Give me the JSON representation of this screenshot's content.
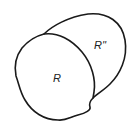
{
  "diagram": {
    "type": "region-diagram",
    "regions": [
      {
        "id": "R",
        "label": "R"
      },
      {
        "id": "R2",
        "label": "R''"
      }
    ],
    "colors": {
      "background": "#ffffff",
      "stroke": "#1a1a1a",
      "text": "#222222"
    }
  }
}
